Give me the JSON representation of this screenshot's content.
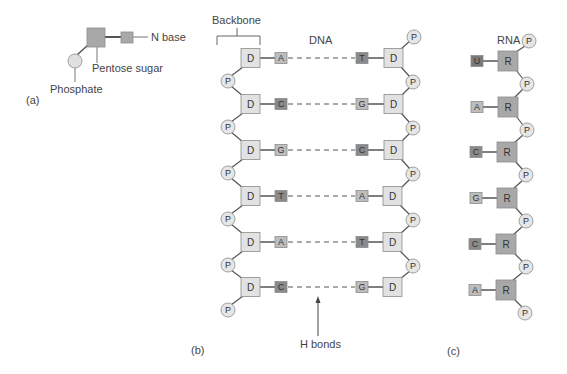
{
  "panel_a": {
    "label": "(a)",
    "phosphate_label": "Phosphate",
    "sugar_label": "Pentose sugar",
    "base_label": "N base"
  },
  "panel_b": {
    "label": "(b)",
    "title": "DNA",
    "backbone_label": "Backbone",
    "hbonds_label": "H bonds",
    "sugar_glyph": "D",
    "phosphate_glyph": "P",
    "pairs": [
      {
        "left": "A",
        "right": "T"
      },
      {
        "left": "C",
        "right": "G"
      },
      {
        "left": "G",
        "right": "C"
      },
      {
        "left": "T",
        "right": "A"
      },
      {
        "left": "A",
        "right": "T"
      },
      {
        "left": "C",
        "right": "G"
      }
    ]
  },
  "panel_c": {
    "label": "(c)",
    "title": "RNA",
    "sugar_glyph": "R",
    "phosphate_glyph": "P",
    "bases": [
      "U",
      "A",
      "C",
      "G",
      "C",
      "A"
    ]
  },
  "colors": {
    "line": "#555555",
    "dna_sugar": "#e2e2e2",
    "rna_sugar": "#a8a8a8",
    "phosphate": "#e6e6e6",
    "base_light": "#bdbdbd",
    "base_dark": "#8a8a8a",
    "base_darkest": "#7a7a7a",
    "pentose_a": "#a8a8a8",
    "stroke": "#8c8c8c"
  }
}
